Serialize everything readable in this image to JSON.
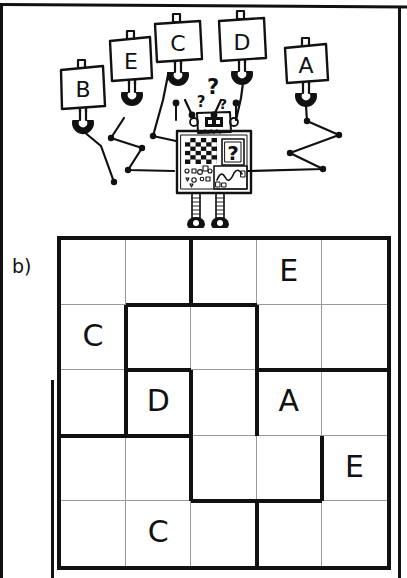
{
  "page": {
    "label": "b)",
    "figure_type": "suguru-letter-puzzle",
    "ink_color": "#111111",
    "background_color": "#ffffff",
    "grid_line_color": "#9a9a9a"
  },
  "illustration": {
    "name": "robot-with-lettered-signs",
    "robot": {
      "head_icon": "robot-face-icon",
      "thought_marks": [
        "?",
        "?",
        "?"
      ],
      "panels": [
        {
          "name": "checkerboard-panel",
          "icon": "checkerboard-icon"
        },
        {
          "name": "question-panel",
          "label": "?"
        },
        {
          "name": "shapes-panel",
          "icon": "shapes-icon"
        },
        {
          "name": "waveform-panel",
          "icon": "waveform-icon"
        }
      ],
      "legs": 2,
      "feet": 2
    },
    "signs": [
      {
        "id": "sign-b",
        "label": "B"
      },
      {
        "id": "sign-e",
        "label": "E"
      },
      {
        "id": "sign-c",
        "label": "C"
      },
      {
        "id": "sign-d",
        "label": "D"
      },
      {
        "id": "sign-a",
        "label": "A"
      }
    ],
    "wire_count": 5
  },
  "grid": {
    "rows": 5,
    "cols": 5,
    "cells": [
      [
        {
          "r": 1,
          "c": 1,
          "value": ""
        },
        {
          "r": 1,
          "c": 2,
          "value": ""
        },
        {
          "r": 1,
          "c": 3,
          "value": ""
        },
        {
          "r": 1,
          "c": 4,
          "value": "E"
        },
        {
          "r": 1,
          "c": 5,
          "value": ""
        }
      ],
      [
        {
          "r": 2,
          "c": 1,
          "value": "C"
        },
        {
          "r": 2,
          "c": 2,
          "value": ""
        },
        {
          "r": 2,
          "c": 3,
          "value": ""
        },
        {
          "r": 2,
          "c": 4,
          "value": ""
        },
        {
          "r": 2,
          "c": 5,
          "value": ""
        }
      ],
      [
        {
          "r": 3,
          "c": 1,
          "value": ""
        },
        {
          "r": 3,
          "c": 2,
          "value": "D"
        },
        {
          "r": 3,
          "c": 3,
          "value": ""
        },
        {
          "r": 3,
          "c": 4,
          "value": "A"
        },
        {
          "r": 3,
          "c": 5,
          "value": ""
        }
      ],
      [
        {
          "r": 4,
          "c": 1,
          "value": ""
        },
        {
          "r": 4,
          "c": 2,
          "value": ""
        },
        {
          "r": 4,
          "c": 3,
          "value": ""
        },
        {
          "r": 4,
          "c": 4,
          "value": ""
        },
        {
          "r": 4,
          "c": 5,
          "value": "E"
        }
      ],
      [
        {
          "r": 5,
          "c": 1,
          "value": ""
        },
        {
          "r": 5,
          "c": 2,
          "value": "C"
        },
        {
          "r": 5,
          "c": 3,
          "value": ""
        },
        {
          "r": 5,
          "c": 4,
          "value": ""
        },
        {
          "r": 5,
          "c": 5,
          "value": ""
        }
      ]
    ],
    "givens": [
      "E",
      "C",
      "D",
      "A",
      "E",
      "C"
    ],
    "region_borders": {
      "horizontal": [
        {
          "row_below": 2,
          "col_start": 2,
          "col_end": 4
        },
        {
          "row_below": 3,
          "col_start": 2,
          "col_end": 3
        },
        {
          "row_below": 3,
          "col_start": 4,
          "col_end": 6
        },
        {
          "row_below": 4,
          "col_start": 1,
          "col_end": 3
        },
        {
          "row_below": 4,
          "col_start": 2,
          "col_end": 3
        },
        {
          "row_below": 5,
          "col_start": 3,
          "col_end": 5
        }
      ],
      "vertical": [
        {
          "col_left": 3,
          "row_start": 1,
          "row_end": 2
        },
        {
          "col_left": 2,
          "row_start": 2,
          "row_end": 3
        },
        {
          "col_left": 4,
          "row_start": 2,
          "row_end": 4
        },
        {
          "col_left": 2,
          "row_start": 3,
          "row_end": 4
        },
        {
          "col_left": 3,
          "row_start": 3,
          "row_end": 4
        },
        {
          "col_left": 3,
          "row_start": 4,
          "row_end": 5
        },
        {
          "col_left": 5,
          "row_start": 4,
          "row_end": 5
        },
        {
          "col_left": 4,
          "row_start": 5,
          "row_end": 6
        }
      ]
    }
  }
}
